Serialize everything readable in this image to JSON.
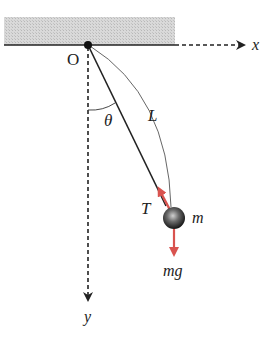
{
  "diagram": {
    "type": "simple-pendulum",
    "colors": {
      "ceiling_fill": "#d4d4d4",
      "line": "#222222",
      "force_arrow": "#d9534f",
      "bob_dark": "#1a1a1a",
      "bob_light": "#bdbdbd"
    },
    "labels": {
      "origin": "O",
      "x_axis": "x",
      "y_axis": "y",
      "angle": "θ",
      "length": "L",
      "tension": "T",
      "mass": "m",
      "weight": "mg"
    },
    "geometry": {
      "pivot": [
        88,
        45
      ],
      "bob_center": [
        174,
        218
      ],
      "bob_radius": 11
    }
  }
}
